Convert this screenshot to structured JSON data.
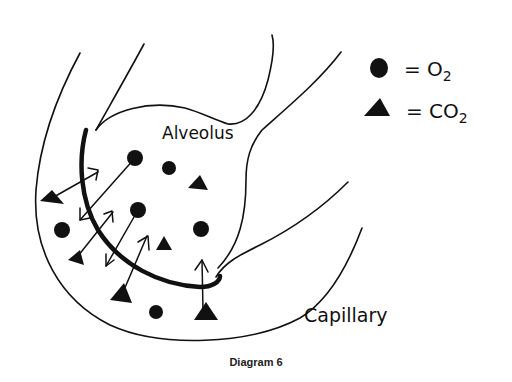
{
  "diagram": {
    "caption": "Diagram 6",
    "labels": {
      "alveolus": "Alveolus",
      "capillary": "Capillary"
    },
    "legend": {
      "items": [
        {
          "symbol": "circle",
          "icon": "o2-circle-icon",
          "text": "= O",
          "subscript": "2"
        },
        {
          "symbol": "triangle",
          "icon": "co2-triangle-icon",
          "text": "= CO",
          "subscript": "2"
        }
      ]
    },
    "colors": {
      "ink": "#111111",
      "background": "#ffffff"
    }
  }
}
